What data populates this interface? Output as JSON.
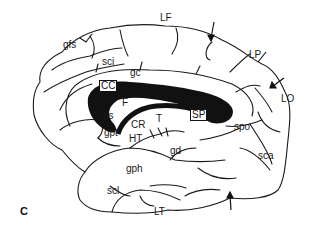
{
  "figure": {
    "panel_letter": "C"
  },
  "labels": {
    "LF": "LF",
    "LP": "LP",
    "LO": "LO",
    "LT": "LT",
    "gfs": "gfs",
    "sci": "sci",
    "gc": "gc",
    "CC": "CC",
    "F": "F",
    "SP": "SP",
    "T": "T",
    "as": "as",
    "gpt": "gpt",
    "CR": "CR",
    "HT": "HT",
    "gd": "gd",
    "spo": "spo",
    "sca": "sca",
    "gph": "gph",
    "scl": "scl"
  },
  "colors": {
    "line": "#1a1a1a",
    "fill_dark": "#111111",
    "background": "#ffffff"
  }
}
